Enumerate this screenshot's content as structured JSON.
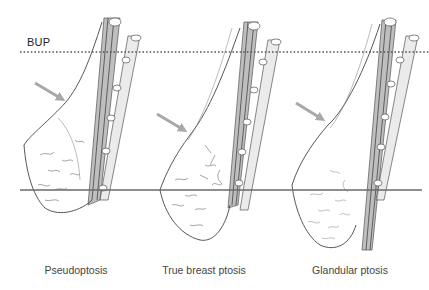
{
  "reference_line": {
    "label": "BUP",
    "style": "dotted",
    "color": "#555555"
  },
  "baseline": {
    "style": "solid",
    "color": "#6a6a6a"
  },
  "arrow_color": "#a8a8a8",
  "panels": [
    {
      "id": "pseudoptosis",
      "caption": "Pseudoptosis",
      "caption_x": 76
    },
    {
      "id": "true-breast-ptosis",
      "caption": "True breast ptosis",
      "caption_x": 204
    },
    {
      "id": "glandular-ptosis",
      "caption": "Glandular ptosis",
      "caption_x": 350
    }
  ]
}
